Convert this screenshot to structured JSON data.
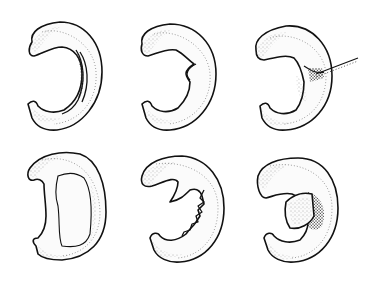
{
  "figure": {
    "layout": {
      "rows": 2,
      "columns": 3
    },
    "colors": {
      "ink": "#111111",
      "background": "#ffffff",
      "stipple": "#555555"
    },
    "panels": [
      {
        "id": "top-left",
        "tear_type": "longitudinal-vertical"
      },
      {
        "id": "top-center",
        "tear_type": "radial-flap"
      },
      {
        "id": "top-right",
        "tear_type": "horizontal-cleavage-with-probe"
      },
      {
        "id": "bottom-left",
        "tear_type": "bucket-handle-displaced"
      },
      {
        "id": "bottom-center",
        "tear_type": "degenerative-complex"
      },
      {
        "id": "bottom-right",
        "tear_type": "displaced-flap"
      }
    ]
  }
}
